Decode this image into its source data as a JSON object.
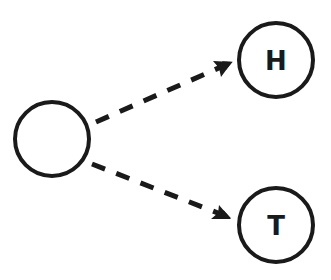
{
  "diagram": {
    "type": "tree",
    "colors": {
      "stroke": "#1a1a1a",
      "fill": "#ffffff"
    },
    "nodes": [
      {
        "id": "root",
        "label": ""
      },
      {
        "id": "heads",
        "label": "H"
      },
      {
        "id": "tails",
        "label": "T"
      }
    ],
    "edges": [
      {
        "from": "root",
        "to": "heads",
        "style": "dashed-arrow"
      },
      {
        "from": "root",
        "to": "tails",
        "style": "dashed-arrow"
      }
    ]
  }
}
